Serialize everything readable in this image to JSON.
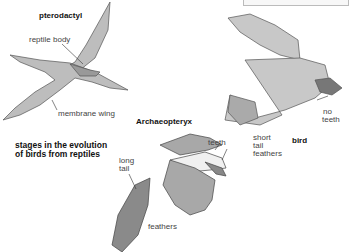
{
  "figure": {
    "caption": "stages in the evolution of birds from reptiles",
    "caption_lines": [
      "stages in the evolution",
      "of birds from reptiles"
    ]
  },
  "pterodactyl": {
    "title": "pterodactyl",
    "labels": [
      "reptile body",
      "membrane wing"
    ]
  },
  "archaeopteryx": {
    "title": "Archaeopteryx",
    "labels": [
      "teeth",
      "long",
      "tail",
      "feathers"
    ]
  },
  "bird": {
    "title": "bird",
    "labels": [
      "no",
      "teeth",
      "short",
      "tail",
      "feathers"
    ]
  }
}
